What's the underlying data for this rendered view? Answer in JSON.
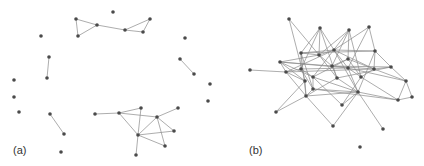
{
  "figure": {
    "panels": [
      {
        "label": "(a)",
        "label_pos": [
          13,
          150
        ],
        "nodes": [
          [
            113,
            12
          ],
          [
            76,
            19
          ],
          [
            97,
            25
          ],
          [
            78,
            36
          ],
          [
            125,
            30
          ],
          [
            150,
            19
          ],
          [
            143,
            32
          ],
          [
            41,
            36
          ],
          [
            185,
            38
          ],
          [
            49,
            57
          ],
          [
            47,
            78
          ],
          [
            180,
            59
          ],
          [
            194,
            74
          ],
          [
            14,
            80
          ],
          [
            14,
            97
          ],
          [
            19,
            112
          ],
          [
            210,
            84
          ],
          [
            208,
            101
          ],
          [
            50,
            114
          ],
          [
            64,
            134
          ],
          [
            61,
            152
          ],
          [
            95,
            114
          ],
          [
            119,
            113
          ],
          [
            141,
            108
          ],
          [
            178,
            108
          ],
          [
            157,
            117
          ],
          [
            138,
            135
          ],
          [
            174,
            131
          ],
          [
            165,
            146
          ],
          [
            136,
            155
          ]
        ],
        "edges": [
          [
            1,
            2
          ],
          [
            1,
            3
          ],
          [
            2,
            3
          ],
          [
            2,
            4
          ],
          [
            4,
            6
          ],
          [
            4,
            5
          ],
          [
            5,
            6
          ],
          [
            9,
            10
          ],
          [
            11,
            12
          ],
          [
            18,
            19
          ],
          [
            21,
            22
          ],
          [
            22,
            23
          ],
          [
            22,
            25
          ],
          [
            22,
            26
          ],
          [
            23,
            26
          ],
          [
            24,
            25
          ],
          [
            25,
            26
          ],
          [
            25,
            27
          ],
          [
            25,
            28
          ],
          [
            26,
            27
          ],
          [
            26,
            28
          ],
          [
            26,
            29
          ]
        ]
      },
      {
        "label": "(b)",
        "label_pos": [
          249,
          150
        ],
        "nodes": [
          [
            289,
            19
          ],
          [
            320,
            28
          ],
          [
            349,
            30
          ],
          [
            369,
            27
          ],
          [
            301,
            53
          ],
          [
            319,
            55
          ],
          [
            334,
            50
          ],
          [
            348,
            59
          ],
          [
            375,
            51
          ],
          [
            280,
            62
          ],
          [
            250,
            70
          ],
          [
            286,
            72
          ],
          [
            301,
            69
          ],
          [
            332,
            66
          ],
          [
            348,
            68
          ],
          [
            374,
            69
          ],
          [
            391,
            67
          ],
          [
            313,
            77
          ],
          [
            337,
            78
          ],
          [
            361,
            77
          ],
          [
            406,
            81
          ],
          [
            313,
            89
          ],
          [
            305,
            81
          ],
          [
            306,
            96
          ],
          [
            358,
            92
          ],
          [
            342,
            105
          ],
          [
            398,
            100
          ],
          [
            412,
            97
          ],
          [
            276,
            112
          ],
          [
            333,
            126
          ],
          [
            383,
            129
          ],
          [
            360,
            147
          ]
        ],
        "edges": [
          [
            0,
            22
          ],
          [
            0,
            5
          ],
          [
            1,
            4
          ],
          [
            1,
            5
          ],
          [
            1,
            12
          ],
          [
            1,
            6
          ],
          [
            1,
            18
          ],
          [
            2,
            5
          ],
          [
            2,
            7
          ],
          [
            2,
            13
          ],
          [
            2,
            17
          ],
          [
            2,
            19
          ],
          [
            3,
            6
          ],
          [
            3,
            8
          ],
          [
            3,
            14
          ],
          [
            4,
            5
          ],
          [
            4,
            8
          ],
          [
            4,
            12
          ],
          [
            4,
            21
          ],
          [
            4,
            23
          ],
          [
            4,
            6
          ],
          [
            5,
            13
          ],
          [
            5,
            18
          ],
          [
            5,
            9
          ],
          [
            5,
            6
          ],
          [
            6,
            8
          ],
          [
            6,
            14
          ],
          [
            6,
            11
          ],
          [
            6,
            15
          ],
          [
            6,
            24
          ],
          [
            7,
            13
          ],
          [
            7,
            15
          ],
          [
            7,
            17
          ],
          [
            7,
            19
          ],
          [
            8,
            15
          ],
          [
            8,
            16
          ],
          [
            8,
            24
          ],
          [
            9,
            11
          ],
          [
            9,
            13
          ],
          [
            9,
            22
          ],
          [
            9,
            17
          ],
          [
            9,
            14
          ],
          [
            10,
            11
          ],
          [
            11,
            12
          ],
          [
            11,
            22
          ],
          [
            11,
            23
          ],
          [
            11,
            15
          ],
          [
            12,
            14
          ],
          [
            12,
            17
          ],
          [
            12,
            21
          ],
          [
            13,
            15
          ],
          [
            13,
            18
          ],
          [
            13,
            16
          ],
          [
            14,
            19
          ],
          [
            14,
            24
          ],
          [
            14,
            20
          ],
          [
            15,
            16
          ],
          [
            15,
            19
          ],
          [
            15,
            20
          ],
          [
            16,
            20
          ],
          [
            16,
            18
          ],
          [
            17,
            21
          ],
          [
            17,
            24
          ],
          [
            17,
            25
          ],
          [
            18,
            24
          ],
          [
            18,
            23
          ],
          [
            19,
            25
          ],
          [
            19,
            26
          ],
          [
            20,
            27
          ],
          [
            20,
            26
          ],
          [
            21,
            23
          ],
          [
            21,
            26
          ],
          [
            21,
            24
          ],
          [
            22,
            23
          ],
          [
            23,
            29
          ],
          [
            23,
            24
          ],
          [
            23,
            28
          ],
          [
            24,
            30
          ],
          [
            24,
            25
          ],
          [
            24,
            26
          ],
          [
            24,
            29
          ],
          [
            26,
            27
          ],
          [
            22,
            28
          ]
        ]
      }
    ],
    "style": {
      "node_color": "#4a4a4a",
      "edge_color": "#8a8a8a",
      "node_radius": 1.8
    }
  }
}
